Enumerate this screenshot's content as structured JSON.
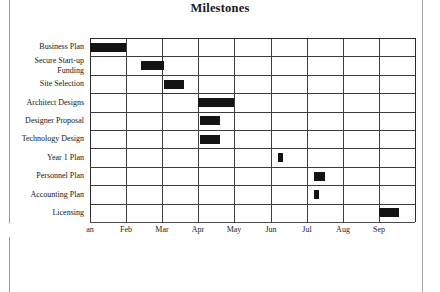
{
  "page": {
    "title": "Milestones",
    "background_color": "#ffffff",
    "ink_color": "#131313",
    "border_color": "#9a9a9a"
  },
  "chart_data": {
    "type": "bar",
    "chart_variant": "gantt",
    "title": "Milestones",
    "xlabel": "",
    "ylabel": "",
    "grid": true,
    "legend": false,
    "x_axis": {
      "tick_labels": [
        "Jan",
        "Feb",
        "Mar",
        "Apr",
        "May",
        "Jun",
        "Jul",
        "Aug",
        "Sep"
      ],
      "tick_label_rendered_first": "an",
      "unit": "month",
      "range": [
        "Jan",
        "Sep"
      ]
    },
    "categories": [
      "Business Plan",
      "Secure Start-up Funding",
      "Site Selection",
      "Architect Designs",
      "Designer Proposal",
      "Technology Design",
      "Year 1 Plan",
      "Personnel Plan",
      "Accounting Plan",
      "Licensing"
    ],
    "tasks": [
      {
        "name": "Business Plan",
        "label_lines": [
          "Business Plan"
        ],
        "start_month": 1.0,
        "end_month": 2.0,
        "duration_months": 1.0
      },
      {
        "name": "Secure Start-up Funding",
        "label_lines": [
          "Secure Start-up",
          "Funding"
        ],
        "start_month": 2.4,
        "end_month": 3.05,
        "duration_months": 0.65
      },
      {
        "name": "Site Selection",
        "label_lines": [
          "Site Selection"
        ],
        "start_month": 3.05,
        "end_month": 3.6,
        "duration_months": 0.55
      },
      {
        "name": "Architect Designs",
        "label_lines": [
          "Architect Designs"
        ],
        "start_month": 4.0,
        "end_month": 5.0,
        "duration_months": 1.0
      },
      {
        "name": "Designer Proposal",
        "label_lines": [
          "Designer Proposal"
        ],
        "start_month": 4.05,
        "end_month": 4.6,
        "duration_months": 0.55
      },
      {
        "name": "Technology Design",
        "label_lines": [
          "Technology Design"
        ],
        "start_month": 4.05,
        "end_month": 4.6,
        "duration_months": 0.55
      },
      {
        "name": "Year 1 Plan",
        "label_lines": [
          "Year 1 Plan"
        ],
        "start_month": 6.2,
        "end_month": 6.35,
        "duration_months": 0.15
      },
      {
        "name": "Personnel Plan",
        "label_lines": [
          "Personnel Plan"
        ],
        "start_month": 7.2,
        "end_month": 7.5,
        "duration_months": 0.3
      },
      {
        "name": "Accounting Plan",
        "label_lines": [
          "Accounting Plan"
        ],
        "start_month": 7.2,
        "end_month": 7.35,
        "duration_months": 0.15
      },
      {
        "name": "Licensing",
        "label_lines": [
          "Licensing"
        ],
        "start_month": 9.0,
        "end_month": 9.55,
        "duration_months": 0.55
      }
    ]
  }
}
